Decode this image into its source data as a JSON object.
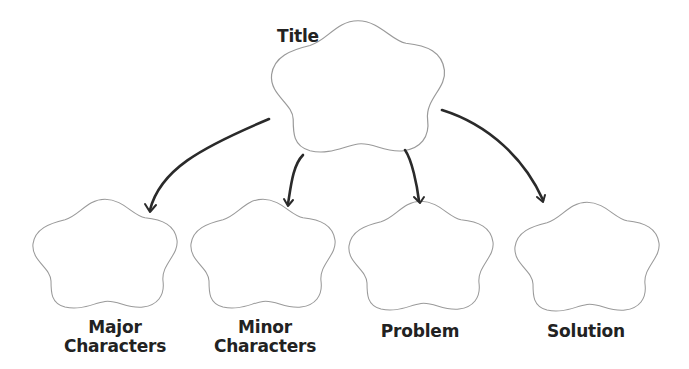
{
  "diagram": {
    "title": {
      "label": "Title"
    },
    "nodes": [
      {
        "id": "major",
        "label_line1": "Major",
        "label_line2": "Characters"
      },
      {
        "id": "minor",
        "label_line1": "Minor",
        "label_line2": "Characters"
      },
      {
        "id": "problem",
        "label_line1": "Problem",
        "label_line2": ""
      },
      {
        "id": "solution",
        "label_line1": "Solution",
        "label_line2": ""
      }
    ],
    "edges": [
      {
        "from": "title",
        "to": "major"
      },
      {
        "from": "title",
        "to": "minor"
      },
      {
        "from": "title",
        "to": "problem"
      },
      {
        "from": "title",
        "to": "solution"
      }
    ],
    "colors": {
      "outline": "#9a9a9a",
      "arrow": "#2a2a2a",
      "text": "#222222"
    }
  }
}
